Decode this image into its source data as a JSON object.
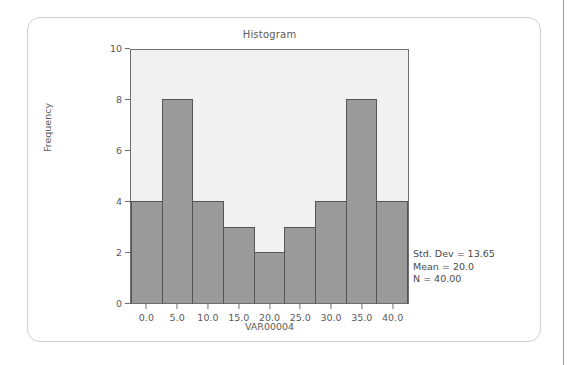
{
  "card": {
    "name": "histogram-card"
  },
  "chart_data": {
    "type": "bar",
    "title": "Histogram",
    "xlabel": "VAR00004",
    "ylabel": "Frequency",
    "categories": [
      "0.0",
      "5.0",
      "10.0",
      "15.0",
      "20.0",
      "25.0",
      "30.0",
      "35.0",
      "40.0"
    ],
    "values": [
      4,
      8,
      4,
      3,
      2,
      3,
      4,
      8,
      4
    ],
    "ylim": [
      0,
      10
    ],
    "ytick_labels": [
      "0",
      "2",
      "4",
      "6",
      "8",
      "10"
    ],
    "ytick_values": [
      0,
      2,
      4,
      6,
      8,
      10
    ],
    "xlim": [
      -2.5,
      42.5
    ],
    "grid": false,
    "legend": false,
    "bar_color": "#9a9a9a",
    "bar_edge_color": "#555555",
    "plot_background": "#f1f1f1",
    "annotations": [
      "Std. Dev = 13.65",
      "Mean = 20.0",
      "N = 40.00"
    ]
  },
  "stats": {
    "std_dev": "Std. Dev = 13.65",
    "mean": "Mean = 20.0",
    "n": "N = 40.00"
  }
}
